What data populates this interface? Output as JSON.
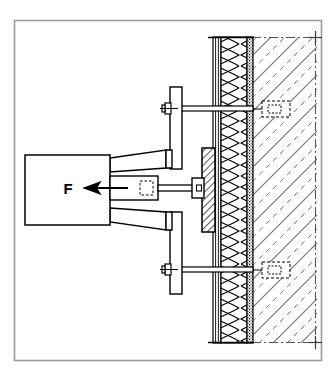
{
  "figure": {
    "border_color": "#9a9a9a",
    "line_color": "#000000",
    "background": "#ffffff"
  },
  "labels": {
    "force": "F"
  },
  "annotations": {
    "force_direction": "arrow-pointing-left",
    "force_arrow_label": "F"
  },
  "components": {
    "actuator": {
      "name": "hydraulic-actuator-body"
    },
    "bracket": {
      "name": "tapered-reaction-bracket"
    },
    "load_cell": {
      "name": "load-cell"
    },
    "pull_rod": {
      "name": "pull-rod"
    },
    "reaction_plates": {
      "name": "reaction-frame-plate"
    },
    "anchor_bolts": {
      "name": "anchor-bolt-assembly",
      "count": 2
    },
    "test_plate": {
      "name": "hatched-test-specimen-plate"
    },
    "detail_boxes": {
      "name": "anchor-detail-callout-box",
      "count": 2
    },
    "centerline_marks": {
      "name": "centerline-cross-mark",
      "count": 2
    }
  },
  "wall": {
    "name": "insulated-wall-assembly",
    "layers": [
      {
        "name": "render-finish-layer",
        "style": "thin-lines"
      },
      {
        "name": "insulation-layer",
        "style": "zigzag-hatch"
      },
      {
        "name": "adhesive-layer",
        "style": "dotted-hatch"
      },
      {
        "name": "substrate-structure",
        "style": "diagonal-hatch"
      }
    ]
  }
}
